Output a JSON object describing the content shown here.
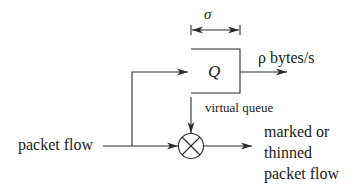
{
  "diagram": {
    "type": "token-bucket / virtual queue marking diagram",
    "labels": {
      "sigma": "σ",
      "queue": "Q",
      "rate": "ρ bytes/s",
      "virtual_queue": "virtual queue",
      "input": "packet flow",
      "output_lines": [
        "marked or",
        "thinned",
        "packet flow"
      ]
    },
    "nodes": [
      {
        "id": "queue",
        "label": "Q",
        "shape": "open-left box"
      },
      {
        "id": "marker",
        "label": "",
        "shape": "circle with X"
      }
    ],
    "edges": [
      {
        "from": "input",
        "to": "queue"
      },
      {
        "from": "input",
        "to": "marker"
      },
      {
        "from": "queue",
        "to": "marker",
        "label": "virtual queue"
      },
      {
        "from": "queue",
        "to": "drain",
        "label": "ρ bytes/s"
      },
      {
        "from": "marker",
        "to": "output",
        "label": "marked or thinned packet flow"
      }
    ],
    "colors": {
      "stroke": "#2a2a2a",
      "background": "#ffffff"
    }
  }
}
